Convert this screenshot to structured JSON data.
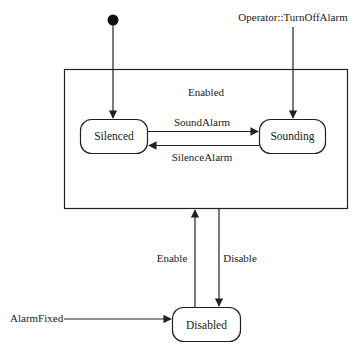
{
  "diagram": {
    "type": "uml-state-machine",
    "colors": {
      "stroke": "#222222",
      "background": "#ffffff"
    },
    "composite_state": {
      "id": "enabled",
      "label": "Enabled"
    },
    "initial_node": {
      "target": "silenced"
    },
    "states": [
      {
        "id": "silenced",
        "label": "Silenced"
      },
      {
        "id": "sounding",
        "label": "Sounding"
      },
      {
        "id": "disabled",
        "label": "Disabled"
      }
    ],
    "transitions": [
      {
        "from": "silenced",
        "to": "sounding",
        "label": "SoundAlarm"
      },
      {
        "from": "sounding",
        "to": "silenced",
        "label": "SilenceAlarm"
      },
      {
        "from": "external",
        "to": "sounding",
        "label": "Operator::TurnOffAlarm"
      },
      {
        "from": "disabled",
        "to": "enabled",
        "label": "Enable"
      },
      {
        "from": "enabled",
        "to": "disabled",
        "label": "Disable"
      },
      {
        "from": "external",
        "to": "disabled",
        "label": "AlarmFixed"
      }
    ]
  }
}
